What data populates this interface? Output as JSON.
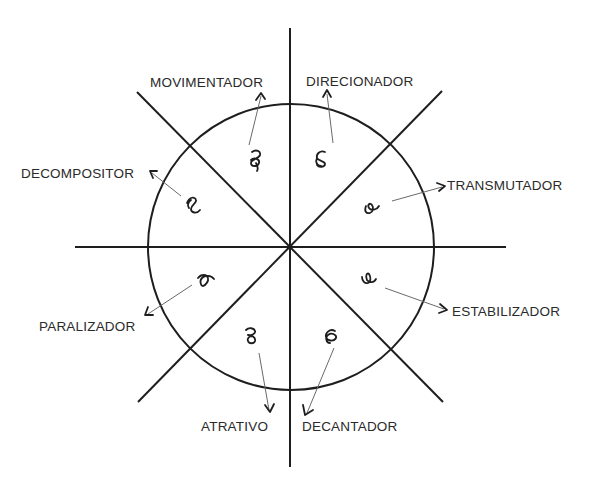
{
  "diagram": {
    "type": "radial-eight-sector",
    "center": [
      290,
      247
    ],
    "radius": 143,
    "colors": {
      "line": "#1e1e1e",
      "pointer": "#6a6a6a",
      "text": "#2a2a2a",
      "background": "#ffffff"
    },
    "labels": {
      "movimentador": "MOVIMENTADOR",
      "direcionador": "DIRECIONADOR",
      "decompositor": "DECOMPOSITOR",
      "transmutador": "TRANSMUTADOR",
      "paralizador": "PARALIZADOR",
      "estabilizador": "ESTABILIZADOR",
      "atrativo": "ATRATIVO",
      "decantador": "DECANTADOR"
    },
    "sectors": [
      {
        "name": "MOVIMENTADOR",
        "position": "top-left-upper",
        "glyph": "loop-curl-down"
      },
      {
        "name": "DIRECIONADOR",
        "position": "top-right-upper",
        "glyph": "loop-curl-left"
      },
      {
        "name": "DECOMPOSITOR",
        "position": "top-left-lower",
        "glyph": "loop-curl-right"
      },
      {
        "name": "TRANSMUTADOR",
        "position": "top-right-lower",
        "glyph": "loop-curl-up"
      },
      {
        "name": "PARALIZADOR",
        "position": "bottom-left-upper",
        "glyph": "loop-curl-down"
      },
      {
        "name": "ESTABILIZADOR",
        "position": "bottom-right-upper",
        "glyph": "loop-curl-up"
      },
      {
        "name": "ATRATIVO",
        "position": "bottom-left-lower",
        "glyph": "loop-curl-down"
      },
      {
        "name": "DECANTADOR",
        "position": "bottom-right-lower",
        "glyph": "loop-curl-left"
      }
    ]
  }
}
